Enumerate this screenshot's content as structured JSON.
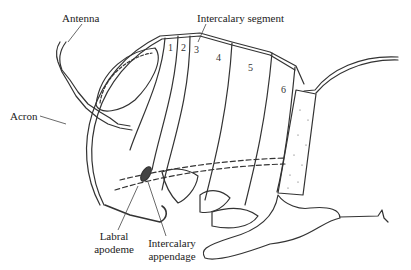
{
  "diagram": {
    "labels": {
      "antenna": "Antenna",
      "acron": "Acron",
      "intercalary_segment": "Intercalary segment",
      "labral_apodeme_line1": "Labral",
      "labral_apodeme_line2": "apodeme",
      "intercalary_appendage_line1": "Intercalary",
      "intercalary_appendage_line2": "appendage"
    },
    "segment_numbers": [
      "1",
      "2",
      "3",
      "4",
      "5",
      "6"
    ],
    "colors": {
      "stroke": "#333333",
      "background": "#ffffff"
    }
  }
}
